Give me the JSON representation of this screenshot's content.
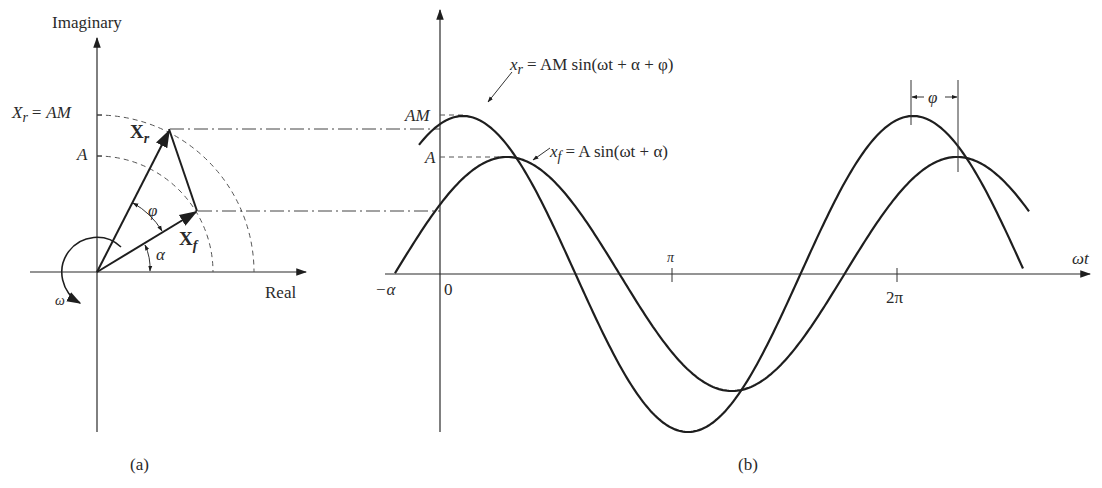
{
  "figure": {
    "panel_a": {
      "caption": "(a)",
      "imag_axis_label": "Imaginary",
      "real_axis_label": "Real",
      "label_xr_eq": "X",
      "label_xr_eq_sub": "r",
      "label_xr_eq_rhs": "= AM",
      "label_A": "A",
      "vector_xr": "X",
      "vector_xr_sub": "r",
      "vector_xf": "X",
      "vector_xf_sub": "f",
      "angle_phi": "φ",
      "angle_alpha": "α",
      "rotation_omega": "ω"
    },
    "panel_b": {
      "caption": "(b)",
      "label_AM": "AM",
      "label_A": "A",
      "eq_xr_lhs": "x",
      "eq_xr_sub": "r",
      "eq_xr_rhs": "= AM sin(ωt + α + φ)",
      "eq_xf_lhs": "x",
      "eq_xf_sub": "f",
      "eq_xf_rhs": "= A sin(ωt + α)",
      "tick_neg_alpha": "−α",
      "tick_zero": "0",
      "tick_pi": "π",
      "tick_2pi": "2π",
      "x_axis_label": "ωt",
      "phase_marker": "φ"
    }
  },
  "chart_data": {
    "type": "line",
    "title": "",
    "xlabel": "ωt",
    "ylabel": "",
    "x_ticks": [
      "−α",
      "0",
      "π",
      "2π"
    ],
    "series": [
      {
        "name": "x_r = AM sin(ωt + α + φ)",
        "amplitude": "AM",
        "phase_rad": 1.23
      },
      {
        "name": "x_f = A sin(ωt + α)",
        "amplitude": "A",
        "phase_rad": 0.65
      }
    ],
    "annotations": [
      "AM",
      "A",
      "φ (phase lead of x_r over x_f)"
    ]
  }
}
